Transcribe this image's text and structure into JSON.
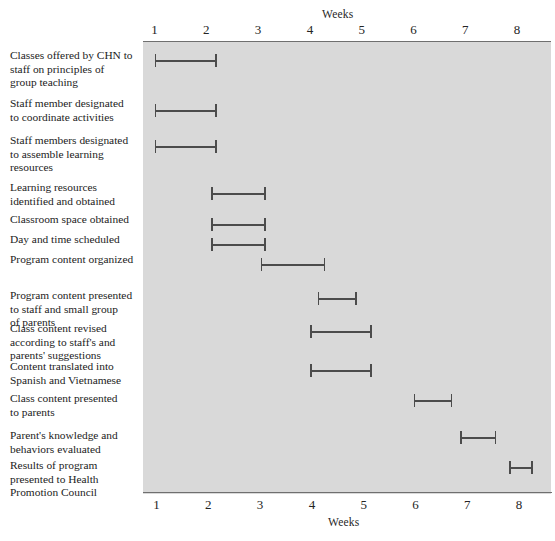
{
  "chart_data": {
    "type": "bar",
    "chart_subtype": "gantt",
    "title": "",
    "xlabel": "Weeks",
    "ylabel": "",
    "xlim": [
      0.6,
      8.45
    ],
    "xticks": [
      1,
      2,
      3,
      4,
      5,
      6,
      7,
      8
    ],
    "xtick_labels": [
      "1",
      "2",
      "3",
      "4",
      "5",
      "6",
      "7",
      "8"
    ],
    "grid": false,
    "legend": null,
    "axis_title_top": "Weeks",
    "axis_title_bottom": "Weeks",
    "plot_background": "#d9d9d9",
    "bar_color": "#4c4c4c",
    "categories": [
      "Classes offered by CHN to staff on principles of group teaching",
      "Staff member designated to coordinate activities",
      "Staff members designated to assemble learning resources",
      "Learning resources identified and obtained",
      "Classroom space obtained",
      "Day and time scheduled",
      "Program content organized",
      "Program content presented to staff and small group of parents",
      "Class content revised according to staff's and parents' suggestions",
      "Content translated into Spanish and Vietnamese",
      "Class content presented to parents",
      "Parent's knowledge and behaviors evaluated",
      "Results of program presented to Health Promotion Council"
    ],
    "tasks": [
      {
        "label": "Classes offered by CHN to staff on principles of group teaching",
        "label_lines": [
          "Classes offered by CHN to",
          "staff on principles of",
          "group teaching"
        ],
        "start": 1.0,
        "end": 2.2
      },
      {
        "label": "Staff member designated to coordinate activities",
        "label_lines": [
          "Staff member designated",
          "to coordinate activities"
        ],
        "start": 1.0,
        "end": 2.2
      },
      {
        "label": "Staff members designated to assemble learning resources",
        "label_lines": [
          "Staff members designated",
          "to assemble learning",
          "resources"
        ],
        "start": 1.0,
        "end": 2.2
      },
      {
        "label": "Learning resources identified and obtained",
        "label_lines": [
          "Learning resources",
          "identified and obtained"
        ],
        "start": 2.1,
        "end": 3.15
      },
      {
        "label": "Classroom space obtained",
        "label_lines": [
          "Classroom space obtained"
        ],
        "start": 2.1,
        "end": 3.15
      },
      {
        "label": "Day and time scheduled",
        "label_lines": [
          "Day and time scheduled"
        ],
        "start": 2.1,
        "end": 3.15
      },
      {
        "label": "Program content organized",
        "label_lines": [
          "Program content organized"
        ],
        "start": 3.05,
        "end": 4.3
      },
      {
        "label": "Program content presented to staff and small group of parents",
        "label_lines": [
          "Program content presented",
          "to staff and small group",
          "of parents"
        ],
        "start": 4.15,
        "end": 4.9
      },
      {
        "label": "Class content revised according to staff's and parents' suggestions",
        "label_lines": [
          "Class content revised",
          "according to staff's and",
          "parents' suggestions"
        ],
        "start": 4.0,
        "end": 5.2
      },
      {
        "label": "Content translated into Spanish and Vietnamese",
        "label_lines": [
          "Content translated into",
          "Spanish and Vietnamese"
        ],
        "start": 4.0,
        "end": 5.2
      },
      {
        "label": "Class content presented to parents",
        "label_lines": [
          "Class content presented",
          "to parents"
        ],
        "start": 6.0,
        "end": 6.75
      },
      {
        "label": "Parent's knowledge and behaviors evaluated",
        "label_lines": [
          "Parent's knowledge and",
          "behaviors evaluated"
        ],
        "start": 6.9,
        "end": 7.6
      },
      {
        "label": "Results of program presented to Health Promotion Council",
        "label_lines": [
          "Results of program",
          "presented to Health",
          "Promotion Council"
        ],
        "start": 7.85,
        "end": 8.3
      }
    ]
  }
}
